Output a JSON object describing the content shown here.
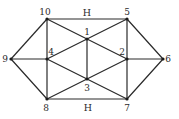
{
  "diagram": {
    "type": "graph",
    "nodes": [
      {
        "id": "1",
        "label": "1",
        "x": 87,
        "y": 39,
        "lx": 87,
        "ly": 35,
        "anchor": "middle"
      },
      {
        "id": "2",
        "label": "2",
        "x": 127,
        "y": 59,
        "lx": 122,
        "ly": 55,
        "anchor": "middle"
      },
      {
        "id": "3",
        "label": "3",
        "x": 87,
        "y": 79,
        "lx": 87,
        "ly": 91,
        "anchor": "middle"
      },
      {
        "id": "4",
        "label": "4",
        "x": 47,
        "y": 59,
        "lx": 51,
        "ly": 55,
        "anchor": "middle"
      },
      {
        "id": "5",
        "label": "5",
        "x": 127,
        "y": 19,
        "lx": 127,
        "ly": 15,
        "anchor": "middle"
      },
      {
        "id": "6",
        "label": "6",
        "x": 163,
        "y": 59,
        "lx": 168,
        "ly": 62,
        "anchor": "middle"
      },
      {
        "id": "7",
        "label": "7",
        "x": 127,
        "y": 99,
        "lx": 127,
        "ly": 111,
        "anchor": "middle"
      },
      {
        "id": "8",
        "label": "8",
        "x": 47,
        "y": 99,
        "lx": 46,
        "ly": 111,
        "anchor": "middle"
      },
      {
        "id": "9",
        "label": "9",
        "x": 11,
        "y": 59,
        "lx": 5,
        "ly": 62,
        "anchor": "middle"
      },
      {
        "id": "10",
        "label": "10",
        "x": 47,
        "y": 19,
        "lx": 45,
        "ly": 15,
        "anchor": "middle"
      }
    ],
    "edges": [
      {
        "from": "10",
        "to": "5",
        "label": "H"
      },
      {
        "from": "8",
        "to": "7",
        "label": "H"
      },
      {
        "from": "10",
        "to": "9"
      },
      {
        "from": "9",
        "to": "8"
      },
      {
        "from": "9",
        "to": "4"
      },
      {
        "from": "10",
        "to": "4"
      },
      {
        "from": "4",
        "to": "8"
      },
      {
        "from": "10",
        "to": "1"
      },
      {
        "from": "1",
        "to": "2"
      },
      {
        "from": "5",
        "to": "1"
      },
      {
        "from": "1",
        "to": "4"
      },
      {
        "from": "1",
        "to": "3"
      },
      {
        "from": "4",
        "to": "3"
      },
      {
        "from": "3",
        "to": "7"
      },
      {
        "from": "8",
        "to": "3"
      },
      {
        "from": "3",
        "to": "2"
      },
      {
        "from": "5",
        "to": "2"
      },
      {
        "from": "2",
        "to": "7"
      },
      {
        "from": "2",
        "to": "6"
      },
      {
        "from": "5",
        "to": "6"
      },
      {
        "from": "6",
        "to": "7"
      }
    ],
    "edge_labels": [
      {
        "text": "H",
        "x": 87,
        "y": 16
      },
      {
        "text": "H",
        "x": 88,
        "y": 111
      }
    ]
  }
}
